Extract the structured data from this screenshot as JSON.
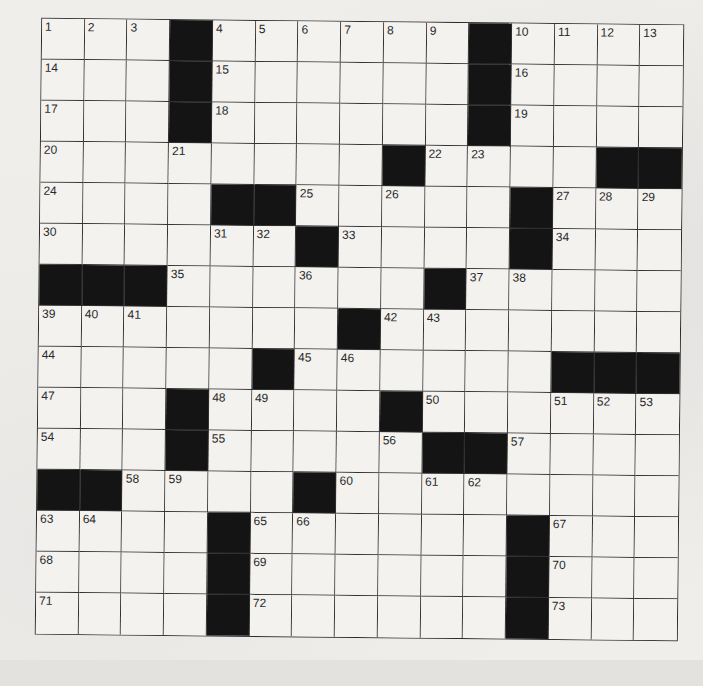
{
  "puzzle": {
    "rows": 15,
    "cols": 15,
    "grid": [
      [
        "1",
        "2",
        "3",
        "#",
        "4",
        "5",
        "6",
        "7",
        "8",
        "9",
        "#",
        "10",
        "11",
        "12",
        "13"
      ],
      [
        "14",
        "",
        "",
        "#",
        "15",
        "",
        "",
        "",
        "",
        "",
        "#",
        "16",
        "",
        "",
        ""
      ],
      [
        "17",
        "",
        "",
        "#",
        "18",
        "",
        "",
        "",
        "",
        "",
        "#",
        "19",
        "",
        "",
        ""
      ],
      [
        "20",
        "",
        "",
        "21",
        "",
        "",
        "",
        "",
        "#",
        "22",
        "23",
        "",
        "",
        "#",
        "#"
      ],
      [
        "24",
        "",
        "",
        "",
        "#",
        "#",
        "25",
        "",
        "26",
        "",
        "",
        "#",
        "27",
        "28",
        "29"
      ],
      [
        "30",
        "",
        "",
        "",
        "31",
        "32",
        "#",
        "33",
        "",
        "",
        "",
        "#",
        "34",
        "",
        ""
      ],
      [
        "#",
        "#",
        "#",
        "35",
        "",
        "",
        "36",
        "",
        "",
        "#",
        "37",
        "38",
        "",
        "",
        ""
      ],
      [
        "39",
        "40",
        "41",
        "",
        "",
        "",
        "",
        "#",
        "42",
        "43",
        "",
        "",
        "",
        "",
        ""
      ],
      [
        "44",
        "",
        "",
        "",
        "",
        "#",
        "45",
        "46",
        "",
        "",
        "",
        "",
        "#",
        "#",
        "#"
      ],
      [
        "47",
        "",
        "",
        "#",
        "48",
        "49",
        "",
        "",
        "#",
        "50",
        "",
        "",
        "51",
        "52",
        "53"
      ],
      [
        "54",
        "",
        "",
        "#",
        "55",
        "",
        "",
        "",
        "56",
        "#",
        "#",
        "57",
        "",
        "",
        ""
      ],
      [
        "#",
        "#",
        "58",
        "59",
        "",
        "",
        "#",
        "60",
        "",
        "61",
        "62",
        "",
        "",
        "",
        ""
      ],
      [
        "63",
        "64",
        "",
        "",
        "#",
        "65",
        "66",
        "",
        "",
        "",
        "",
        "#",
        "67",
        "",
        ""
      ],
      [
        "68",
        "",
        "",
        "",
        "#",
        "69",
        "",
        "",
        "",
        "",
        "",
        "#",
        "70",
        "",
        ""
      ],
      [
        "71",
        "",
        "",
        "",
        "#",
        "72",
        "",
        "",
        "",
        "",
        "",
        "#",
        "73",
        "",
        ""
      ]
    ],
    "colors": {
      "block": "#141414",
      "cell": "#f3f2ef",
      "line": "#333333",
      "paper": "#efeeeb"
    }
  }
}
